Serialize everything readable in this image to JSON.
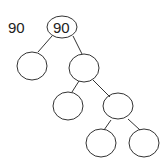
{
  "diagram": {
    "type": "binary-tree",
    "side_label": "90",
    "nodes": [
      {
        "id": "root",
        "value": "90"
      },
      {
        "id": "left",
        "value": ""
      },
      {
        "id": "right",
        "value": ""
      },
      {
        "id": "right-left",
        "value": ""
      },
      {
        "id": "right-right",
        "value": ""
      },
      {
        "id": "right-right-left",
        "value": ""
      },
      {
        "id": "right-right-right",
        "value": ""
      }
    ],
    "edges": [
      [
        "root",
        "left"
      ],
      [
        "root",
        "right"
      ],
      [
        "right",
        "right-left"
      ],
      [
        "right",
        "right-right"
      ],
      [
        "right-right",
        "right-right-left"
      ],
      [
        "right-right",
        "right-right-right"
      ]
    ]
  }
}
